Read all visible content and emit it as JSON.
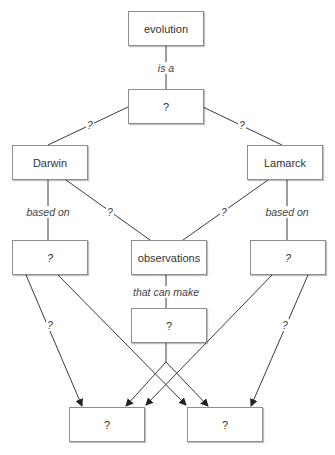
{
  "diagram": {
    "type": "concept-map",
    "nodes": {
      "evolution": "evolution",
      "q_top": "?",
      "darwin": "Darwin",
      "lamarck": "Lamarck",
      "q_left": "?",
      "observations": "observations",
      "q_right": "?",
      "q_obs": "?",
      "q_bottom_left": "?",
      "q_bottom_right": "?"
    },
    "links": {
      "evolution_qtop": "is a",
      "qtop_darwin": "?",
      "qtop_lamarck": "?",
      "darwin_qleft": "based on",
      "darwin_obs": "?",
      "lamarck_obs": "?",
      "lamarck_qright": "based on",
      "obs_qobs": "that can make",
      "qleft_bottomleft": "?",
      "qright_bottomright": "?"
    },
    "colors": {
      "line": "#3a3a3a",
      "border": "#8e8e8e"
    }
  }
}
